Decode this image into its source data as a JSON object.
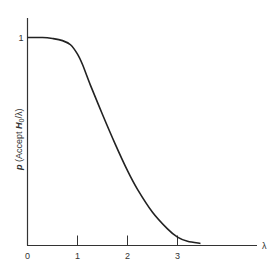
{
  "chart_data": {
    "type": "line",
    "title": "",
    "xlabel": "λ",
    "ylabel": "p (Accept H0/λ)",
    "ylabel_parts": {
      "p": "p",
      "rest1": " (Accept ",
      "H": "H",
      "sub": "0",
      "rest2": "/λ)"
    },
    "xlim": [
      0,
      4.1
    ],
    "ylim": [
      0,
      1.09
    ],
    "grid": false,
    "legend": null,
    "x_ticks": [
      0,
      1,
      2,
      3
    ],
    "x_tick_labels": [
      "0",
      "1",
      "2",
      "3"
    ],
    "y_ticks": [
      1
    ],
    "y_tick_labels": [
      "1"
    ],
    "series": [
      {
        "name": "Operating characteristic",
        "x": [
          0,
          0.3,
          0.5,
          0.7,
          0.86,
          1.0,
          1.1,
          1.26,
          1.5,
          1.75,
          2.0,
          2.2,
          2.5,
          2.8,
          3.0,
          3.2,
          3.46
        ],
        "values": [
          1.0,
          1.0,
          0.995,
          0.985,
          0.965,
          0.92,
          0.87,
          0.77,
          0.63,
          0.49,
          0.36,
          0.27,
          0.16,
          0.08,
          0.04,
          0.02,
          0.01
        ]
      }
    ]
  },
  "colors": {
    "line": "#222222",
    "axis": "#333333",
    "background": "#ffffff"
  }
}
